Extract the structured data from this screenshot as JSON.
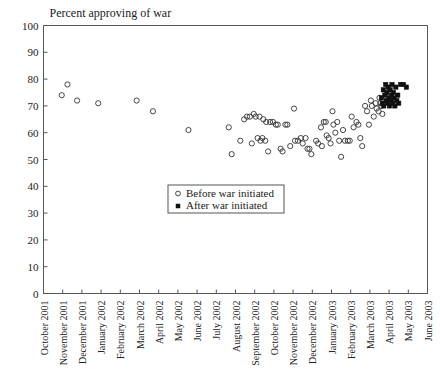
{
  "chart_data": {
    "type": "scatter",
    "title": "Percent approving of war",
    "xlabel": "",
    "ylabel": "",
    "ylim": [
      0,
      100
    ],
    "ytick_step": 10,
    "yticks": [
      0,
      10,
      20,
      30,
      40,
      50,
      60,
      70,
      80,
      90,
      100
    ],
    "grid": false,
    "legend_position": "center",
    "xtick_labels": [
      "October 2001",
      "November 2001",
      "December 2001",
      "January 2002",
      "February 2002",
      "March 2002",
      "April 2002",
      "May 2002",
      "June 2002",
      "July 2002",
      "August 2002",
      "September 2002",
      "October 2002",
      "November 2002",
      "December 2002",
      "January 2003",
      "February 2003",
      "March 2003",
      "April 2003",
      "May 2003",
      "June 2003"
    ],
    "xlim_months": [
      0,
      20
    ],
    "series": [
      {
        "name": "Before war initiated",
        "marker": "open-circle",
        "points": [
          {
            "x": 0.95,
            "y": 74
          },
          {
            "x": 1.25,
            "y": 78
          },
          {
            "x": 1.75,
            "y": 72
          },
          {
            "x": 2.85,
            "y": 71
          },
          {
            "x": 4.85,
            "y": 72
          },
          {
            "x": 5.7,
            "y": 68
          },
          {
            "x": 7.55,
            "y": 61
          },
          {
            "x": 9.65,
            "y": 62
          },
          {
            "x": 9.8,
            "y": 52
          },
          {
            "x": 10.25,
            "y": 57
          },
          {
            "x": 10.45,
            "y": 65
          },
          {
            "x": 10.6,
            "y": 66
          },
          {
            "x": 10.75,
            "y": 66
          },
          {
            "x": 10.85,
            "y": 56
          },
          {
            "x": 10.95,
            "y": 67
          },
          {
            "x": 11.05,
            "y": 66
          },
          {
            "x": 11.15,
            "y": 58
          },
          {
            "x": 11.25,
            "y": 66
          },
          {
            "x": 11.3,
            "y": 57
          },
          {
            "x": 11.4,
            "y": 58
          },
          {
            "x": 11.45,
            "y": 65
          },
          {
            "x": 11.55,
            "y": 57
          },
          {
            "x": 11.6,
            "y": 64
          },
          {
            "x": 11.7,
            "y": 53
          },
          {
            "x": 11.8,
            "y": 64
          },
          {
            "x": 11.95,
            "y": 64
          },
          {
            "x": 12.1,
            "y": 63
          },
          {
            "x": 12.2,
            "y": 63
          },
          {
            "x": 12.35,
            "y": 54
          },
          {
            "x": 12.45,
            "y": 53
          },
          {
            "x": 12.6,
            "y": 63
          },
          {
            "x": 12.7,
            "y": 63
          },
          {
            "x": 12.85,
            "y": 55
          },
          {
            "x": 13.05,
            "y": 69
          },
          {
            "x": 13.1,
            "y": 57
          },
          {
            "x": 13.25,
            "y": 57
          },
          {
            "x": 13.4,
            "y": 58
          },
          {
            "x": 13.5,
            "y": 56
          },
          {
            "x": 13.65,
            "y": 58
          },
          {
            "x": 13.75,
            "y": 54
          },
          {
            "x": 13.85,
            "y": 54
          },
          {
            "x": 13.95,
            "y": 52
          },
          {
            "x": 14.2,
            "y": 57
          },
          {
            "x": 14.3,
            "y": 56
          },
          {
            "x": 14.45,
            "y": 62
          },
          {
            "x": 14.5,
            "y": 55
          },
          {
            "x": 14.6,
            "y": 64
          },
          {
            "x": 14.7,
            "y": 64
          },
          {
            "x": 14.75,
            "y": 59
          },
          {
            "x": 14.85,
            "y": 58
          },
          {
            "x": 14.95,
            "y": 56
          },
          {
            "x": 15.05,
            "y": 68
          },
          {
            "x": 15.1,
            "y": 63
          },
          {
            "x": 15.2,
            "y": 60
          },
          {
            "x": 15.3,
            "y": 64
          },
          {
            "x": 15.4,
            "y": 57
          },
          {
            "x": 15.5,
            "y": 51
          },
          {
            "x": 15.6,
            "y": 61
          },
          {
            "x": 15.7,
            "y": 57
          },
          {
            "x": 15.85,
            "y": 57
          },
          {
            "x": 15.95,
            "y": 57
          },
          {
            "x": 16.05,
            "y": 66
          },
          {
            "x": 16.15,
            "y": 62
          },
          {
            "x": 16.3,
            "y": 64
          },
          {
            "x": 16.4,
            "y": 63
          },
          {
            "x": 16.5,
            "y": 58
          },
          {
            "x": 16.6,
            "y": 55
          },
          {
            "x": 16.75,
            "y": 70
          },
          {
            "x": 16.85,
            "y": 68
          },
          {
            "x": 16.95,
            "y": 63
          },
          {
            "x": 17.05,
            "y": 72
          },
          {
            "x": 17.1,
            "y": 70
          },
          {
            "x": 17.2,
            "y": 66
          },
          {
            "x": 17.3,
            "y": 71
          },
          {
            "x": 17.35,
            "y": 69
          },
          {
            "x": 17.45,
            "y": 68
          },
          {
            "x": 17.5,
            "y": 73
          },
          {
            "x": 17.55,
            "y": 71
          },
          {
            "x": 17.6,
            "y": 70
          },
          {
            "x": 17.65,
            "y": 67
          }
        ]
      },
      {
        "name": "After war initiated",
        "marker": "filled-square",
        "points": [
          {
            "x": 17.6,
            "y": 73
          },
          {
            "x": 17.65,
            "y": 71
          },
          {
            "x": 17.7,
            "y": 76
          },
          {
            "x": 17.72,
            "y": 70
          },
          {
            "x": 17.78,
            "y": 74
          },
          {
            "x": 17.82,
            "y": 78
          },
          {
            "x": 17.85,
            "y": 72
          },
          {
            "x": 17.88,
            "y": 75
          },
          {
            "x": 17.92,
            "y": 71
          },
          {
            "x": 17.95,
            "y": 77
          },
          {
            "x": 18.0,
            "y": 73
          },
          {
            "x": 18.02,
            "y": 70
          },
          {
            "x": 18.05,
            "y": 76
          },
          {
            "x": 18.1,
            "y": 72
          },
          {
            "x": 18.12,
            "y": 74
          },
          {
            "x": 18.15,
            "y": 78
          },
          {
            "x": 18.18,
            "y": 71
          },
          {
            "x": 18.22,
            "y": 75
          },
          {
            "x": 18.25,
            "y": 73
          },
          {
            "x": 18.3,
            "y": 70
          },
          {
            "x": 18.35,
            "y": 77
          },
          {
            "x": 18.4,
            "y": 72
          },
          {
            "x": 18.45,
            "y": 74
          },
          {
            "x": 18.5,
            "y": 71
          },
          {
            "x": 18.6,
            "y": 78
          },
          {
            "x": 18.75,
            "y": 78
          },
          {
            "x": 18.9,
            "y": 77
          }
        ]
      }
    ]
  },
  "legend": {
    "entries": [
      {
        "label": "Before war initiated",
        "marker": "open-circle"
      },
      {
        "label": "After war initiated",
        "marker": "filled-square"
      }
    ]
  }
}
